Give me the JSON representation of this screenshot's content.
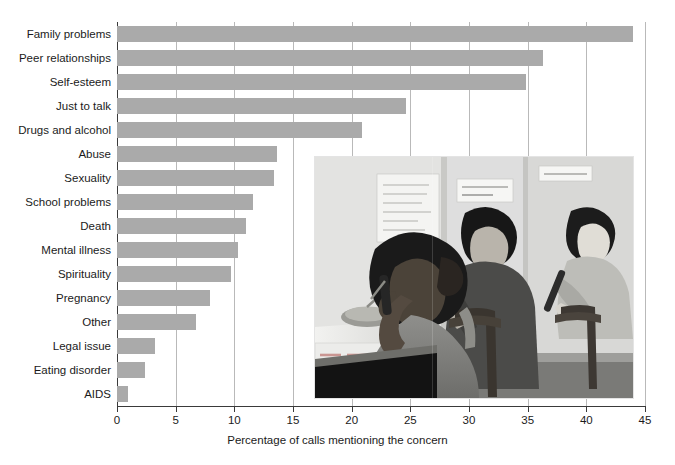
{
  "chart_data": {
    "type": "bar",
    "orientation": "horizontal",
    "title": "",
    "xlabel": "Percentage of calls mentioning the concern",
    "ylabel": "",
    "xlim": [
      0,
      45
    ],
    "xticks": [
      0,
      5,
      10,
      15,
      20,
      25,
      30,
      35,
      40,
      45
    ],
    "xtick_labels": [
      "0",
      "5",
      "10",
      "15",
      "20",
      "25",
      "30",
      "35",
      "40",
      "45"
    ],
    "grid": "vertical",
    "legend": "none",
    "bar_color": "#aaaaaa",
    "categories": [
      "Family problems",
      "Peer relationships",
      "Self-esteem",
      "Just to talk",
      "Drugs and alcohol",
      "Abuse",
      "Sexuality",
      "School problems",
      "Death",
      "Mental illness",
      "Spirituality",
      "Pregnancy",
      "Other",
      "Legal issue",
      "Eating disorder",
      "AIDS"
    ],
    "values": [
      44.0,
      36.3,
      34.9,
      24.6,
      20.9,
      13.6,
      13.4,
      11.6,
      11.0,
      10.3,
      9.7,
      7.9,
      6.7,
      3.2,
      2.4,
      0.9
    ]
  },
  "axis": {
    "x_title": "Percentage of calls mentioning the concern"
  },
  "photo": {
    "alt": "Three teenagers answering telephones at a peer counselling hotline",
    "caption": ""
  }
}
